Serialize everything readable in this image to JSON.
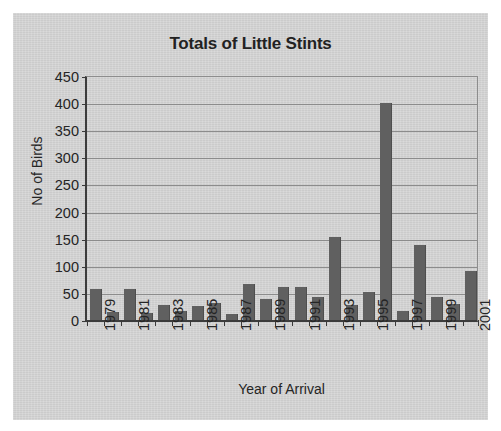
{
  "chart_data": {
    "type": "bar",
    "title": "Totals of Little Stints",
    "xlabel": "Year of Arrival",
    "ylabel": "No of Birds",
    "ylim": [
      0,
      450
    ],
    "ytick_step": 50,
    "ytick_labels": [
      "450",
      "400",
      "350",
      "300",
      "250",
      "200",
      "150",
      "100",
      "50",
      "0"
    ],
    "grid": true,
    "legend": null,
    "bar_color": "#606060",
    "plot_background": "#d3d3d3",
    "categories": [
      "1979",
      "1980",
      "1981",
      "1982",
      "1983",
      "1984",
      "1985",
      "1986",
      "1987",
      "1988",
      "1989",
      "1990",
      "1991",
      "1992",
      "1993",
      "1994",
      "1995",
      "1996",
      "1997",
      "1998",
      "1999",
      "2000",
      "2001"
    ],
    "xtick_labels_shown": [
      "1979",
      "1981",
      "1983",
      "1985",
      "1987",
      "1989",
      "1991",
      "1993",
      "1995",
      "1997",
      "1999",
      "2001"
    ],
    "values": [
      57,
      14,
      57,
      13,
      28,
      17,
      25,
      32,
      11,
      67,
      38,
      60,
      61,
      42,
      153,
      27,
      51,
      400,
      16,
      138,
      42,
      30,
      91
    ]
  }
}
